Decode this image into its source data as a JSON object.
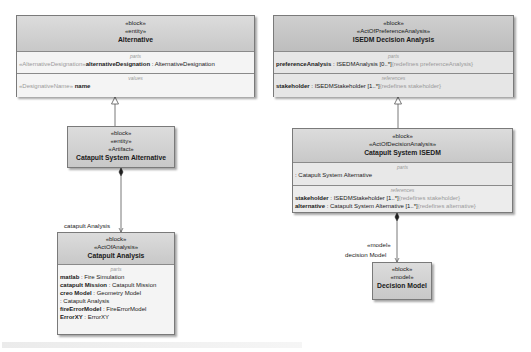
{
  "diagram": {
    "blocks": {
      "alternative": {
        "stereotypes": [
          "«block»",
          "«entity»"
        ],
        "name": "Alternative",
        "compartments": [
          {
            "title": "parts",
            "rows": [
              {
                "prefix": "«AlternativeDesignation»",
                "name": "alternativeDesignation",
                "type": ": AlternativeDesignation",
                "suffix": ""
              }
            ]
          },
          {
            "title": "values",
            "rows": [
              {
                "prefix": "«DesignativeName»",
                "name": "name",
                "type": "",
                "suffix": ""
              }
            ]
          }
        ]
      },
      "isedm_decision_analysis": {
        "stereotypes": [
          "«block»",
          "«ActOfPreferenceAnalysis»"
        ],
        "name": "ISEDM Decision Analysis",
        "compartments": [
          {
            "title": "parts",
            "rows": [
              {
                "prefix": "",
                "name": "preferenceAnalysis",
                "type": ": ISEDMAnalysis [0..*]",
                "suffix": "{redefines preferenceAnalysis}"
              }
            ]
          },
          {
            "title": "references",
            "rows": [
              {
                "prefix": "",
                "name": "stakeholder",
                "type": ": ISEDMStakeholder [1..*]",
                "suffix": "{redefines stakeholder}"
              }
            ]
          }
        ]
      },
      "catapult_system_alternative": {
        "stereotypes": [
          "«block»",
          "«entity»",
          "«Artifact»"
        ],
        "name": "Catapult System Alternative"
      },
      "catapult_system_isedm": {
        "stereotypes": [
          "«block»",
          "«ActOfDecisionAnalysis»"
        ],
        "name": "Catapult System ISEDM",
        "compartments": [
          {
            "title": "parts",
            "rows": [
              {
                "prefix": "",
                "name": "",
                "type": ": Catapult System Alternative",
                "suffix": ""
              }
            ]
          },
          {
            "title": "references",
            "rows": [
              {
                "prefix": "",
                "name": "stakeholder",
                "type": ": ISEDMStakeholder [1..*]",
                "suffix": "{redefines stakeholder}"
              },
              {
                "prefix": "",
                "name": "alternative",
                "type": ": Catapult System Alternative [1..*]",
                "suffix": "{redefines alternative}"
              }
            ]
          }
        ]
      },
      "catapult_analysis": {
        "stereotypes": [
          "«block»",
          "«ActOfAnalysis»"
        ],
        "name": "Catapult Analysis",
        "compartments": [
          {
            "title": "parts",
            "rows": [
              {
                "prefix": "",
                "name": "matlab",
                "type": ": Fire Simulation",
                "suffix": ""
              },
              {
                "prefix": "",
                "name": "catapult Mission",
                "type": ": Catapult Mission",
                "suffix": ""
              },
              {
                "prefix": "",
                "name": "creo Model",
                "type": ": Geometry Model",
                "suffix": ""
              },
              {
                "prefix": "",
                "name": "",
                "type": ": Catapult Analysis",
                "suffix": ""
              },
              {
                "prefix": "",
                "name": "fireErrorModel",
                "type": ": FireErrorModel",
                "suffix": ""
              },
              {
                "prefix": "",
                "name": "ErrorXY",
                "type": ": ErrorXY",
                "suffix": ""
              }
            ]
          }
        ]
      },
      "decision_model": {
        "stereotypes": [
          "«block»",
          "«model»"
        ],
        "name": "Decision Model"
      }
    },
    "connectors": {
      "catapult_analysis_role": "catapult Analysis",
      "decision_model_stereotype": "«model»",
      "decision_model_role": "decision Model"
    },
    "colors": {
      "header": "#cfcfcf",
      "body": "#f4f4f4",
      "border": "#7a7a7a",
      "compartment_title": "#9a9a9a"
    }
  }
}
